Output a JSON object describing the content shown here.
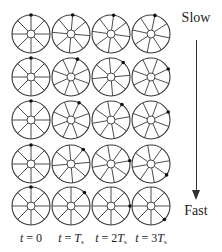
{
  "diagram": {
    "grid": {
      "columns_x": [
        31,
        71,
        111,
        151
      ],
      "rows_y": [
        34,
        77,
        120,
        164,
        206
      ],
      "wheel_radius": 19,
      "hub_radius": 4,
      "spokes": 8
    },
    "rows": [
      {
        "speed_rank": 1,
        "dot_angles_deg": [
          0,
          5,
          8,
          12
        ]
      },
      {
        "speed_rank": 2,
        "dot_angles_deg": [
          0,
          20,
          40,
          65
        ]
      },
      {
        "speed_rank": 3,
        "dot_angles_deg": [
          0,
          25,
          35,
          65
        ]
      },
      {
        "speed_rank": 4,
        "dot_angles_deg": [
          0,
          40,
          80,
          125
        ]
      },
      {
        "speed_rank": 5,
        "dot_angles_deg": [
          0,
          45,
          90,
          135
        ]
      }
    ],
    "time_labels": [
      {
        "var": "t",
        "eq": " = ",
        "val": "0",
        "sub": ""
      },
      {
        "var": "t",
        "eq": " = ",
        "val": "T",
        "sub": "s"
      },
      {
        "var": "t",
        "eq": " = ",
        "val": "2T",
        "sub": "s"
      },
      {
        "var": "t",
        "eq": " = ",
        "val": "3T",
        "sub": "s"
      }
    ],
    "speed_axis": {
      "top_label": "Slow",
      "bottom_label": "Fast",
      "direction": "down"
    },
    "colors": {
      "line": "#3a3a3a",
      "dot": "#111111",
      "background": "#ffffff"
    }
  }
}
